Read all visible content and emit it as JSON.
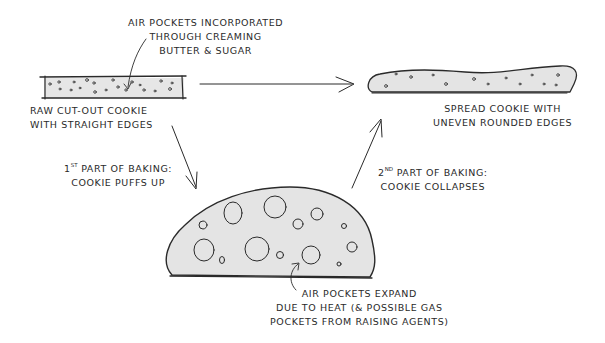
{
  "diagram": {
    "colors": {
      "ink": "#2a2a2a",
      "dough_fill": "#e4e4e4",
      "background": "#ffffff"
    },
    "nodes": {
      "raw_cookie": {
        "label_line1": "Raw cut-out cookie",
        "label_line2": "with straight edges"
      },
      "air_pockets_note": {
        "line1": "Air pockets incorporated",
        "line2": "through creaming",
        "line3": "butter & sugar"
      },
      "spread_cookie": {
        "label_line1": "Spread cookie with",
        "label_line2": "uneven rounded edges"
      },
      "puffed_cookie": {
        "note_line1": "Air pockets expand",
        "note_line2": "due to heat (& possible gas",
        "note_line3": "pockets from raising agents)"
      }
    },
    "edges": {
      "first_baking": {
        "ordinal": "1",
        "ordinal_suffix": "st",
        "line1_rest": "part of baking:",
        "line2": "cookie puffs up"
      },
      "second_baking": {
        "ordinal": "2",
        "ordinal_suffix": "nd",
        "line1_rest": "part of baking:",
        "line2": "cookie collapses"
      },
      "direct": {
        "from": "raw_cookie",
        "to": "spread_cookie"
      }
    }
  }
}
